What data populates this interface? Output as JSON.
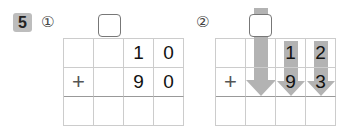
{
  "problem_number": "5",
  "parts": [
    {
      "label": "①",
      "rows": [
        [
          "",
          "",
          "1",
          "0"
        ],
        [
          "+",
          "",
          "9",
          "0"
        ],
        [
          "",
          "",
          "",
          ""
        ]
      ]
    },
    {
      "label": "②",
      "rows": [
        [
          "",
          "",
          "1",
          "2"
        ],
        [
          "+",
          "",
          "9",
          "3"
        ],
        [
          "",
          "",
          "",
          ""
        ]
      ]
    }
  ],
  "colors": {
    "arrow": "#b3b3b3",
    "badge": "#bdbdbd"
  }
}
